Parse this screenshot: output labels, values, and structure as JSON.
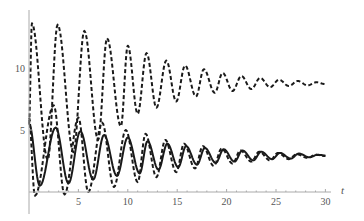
{
  "chart_data": {
    "type": "line",
    "title": "",
    "xlabel": "t",
    "ylabel": "",
    "xlim": [
      0,
      30
    ],
    "ylim": [
      0,
      14
    ],
    "x_ticks": [
      5,
      10,
      15,
      20,
      25,
      30
    ],
    "x_tick_labels": [
      "5",
      "10",
      "15",
      "20",
      "25",
      "30"
    ],
    "y_ticks": [
      5,
      10
    ],
    "y_tick_labels": [
      "5",
      "10"
    ],
    "grid": false,
    "legend": null,
    "series": [
      {
        "name": "upper-dashed",
        "style": "dashed",
        "points": [
          [
            0,
            5.5
          ],
          [
            0.3,
            13.6
          ],
          [
            1.9,
            2.6
          ],
          [
            2.9,
            13.5
          ],
          [
            4.5,
            3.2
          ],
          [
            5.6,
            13.0
          ],
          [
            7.0,
            4.2
          ],
          [
            7.9,
            12.4
          ],
          [
            9.3,
            5.3
          ],
          [
            10.0,
            11.8
          ],
          [
            11.0,
            6.3
          ],
          [
            11.9,
            11.2
          ],
          [
            12.9,
            6.8
          ],
          [
            13.9,
            10.6
          ],
          [
            14.9,
            7.3
          ],
          [
            15.8,
            10.2
          ],
          [
            16.9,
            7.7
          ],
          [
            17.7,
            9.9
          ],
          [
            18.8,
            8.0
          ],
          [
            19.6,
            9.6
          ],
          [
            20.6,
            8.15
          ],
          [
            21.5,
            9.35
          ],
          [
            22.5,
            8.3
          ],
          [
            23.4,
            9.2
          ],
          [
            24.4,
            8.45
          ],
          [
            25.3,
            9.05
          ],
          [
            26.3,
            8.55
          ],
          [
            27.2,
            8.95
          ],
          [
            28.2,
            8.6
          ],
          [
            29.1,
            8.85
          ],
          [
            30,
            8.7
          ]
        ]
      },
      {
        "name": "lower-dashed",
        "style": "dashed",
        "points": [
          [
            0,
            6.0
          ],
          [
            0.6,
            -0.3
          ],
          [
            2.5,
            7.0
          ],
          [
            3.6,
            -0.2
          ],
          [
            5.0,
            6.0
          ],
          [
            6.0,
            0.0
          ],
          [
            7.4,
            5.6
          ],
          [
            8.6,
            0.4
          ],
          [
            9.8,
            5.0
          ],
          [
            11.0,
            0.8
          ],
          [
            11.8,
            4.7
          ],
          [
            12.9,
            1.2
          ],
          [
            13.8,
            4.2
          ],
          [
            14.9,
            1.6
          ],
          [
            15.7,
            3.9
          ],
          [
            16.8,
            1.9
          ],
          [
            17.6,
            3.7
          ],
          [
            18.7,
            2.1
          ],
          [
            19.5,
            3.5
          ],
          [
            20.6,
            2.3
          ],
          [
            21.4,
            3.35
          ],
          [
            22.5,
            2.45
          ],
          [
            23.3,
            3.25
          ],
          [
            24.4,
            2.55
          ],
          [
            25.2,
            3.15
          ],
          [
            26.3,
            2.65
          ],
          [
            27.1,
            3.05
          ],
          [
            28.2,
            2.75
          ],
          [
            29.0,
            3.0
          ],
          [
            30,
            2.9
          ]
        ]
      },
      {
        "name": "solid",
        "style": "solid",
        "points": [
          [
            0,
            5.5
          ],
          [
            1.1,
            0.5
          ],
          [
            2.7,
            5.2
          ],
          [
            4.0,
            0.7
          ],
          [
            5.2,
            4.9
          ],
          [
            6.5,
            1.0
          ],
          [
            7.6,
            4.6
          ],
          [
            8.9,
            1.3
          ],
          [
            10.0,
            4.4
          ],
          [
            11.2,
            1.5
          ],
          [
            12.0,
            4.1
          ],
          [
            13.1,
            1.8
          ],
          [
            14.0,
            3.9
          ],
          [
            15.1,
            2.0
          ],
          [
            15.9,
            3.7
          ],
          [
            17.0,
            2.2
          ],
          [
            17.8,
            3.55
          ],
          [
            18.9,
            2.35
          ],
          [
            19.7,
            3.45
          ],
          [
            20.8,
            2.45
          ],
          [
            21.6,
            3.35
          ],
          [
            22.7,
            2.55
          ],
          [
            23.5,
            3.25
          ],
          [
            24.6,
            2.65
          ],
          [
            25.4,
            3.15
          ],
          [
            26.5,
            2.7
          ],
          [
            27.3,
            3.1
          ],
          [
            28.4,
            2.8
          ],
          [
            29.2,
            3.0
          ],
          [
            30,
            2.95
          ]
        ]
      }
    ]
  }
}
